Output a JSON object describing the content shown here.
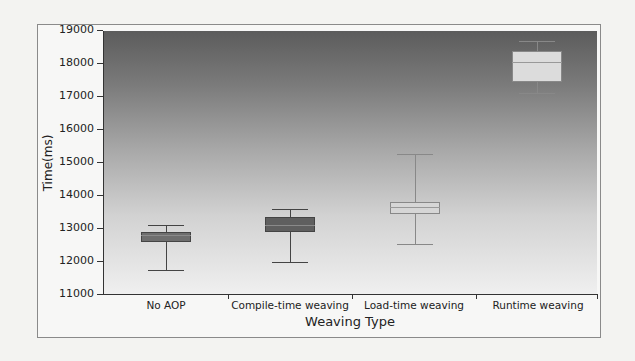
{
  "chart_data": {
    "type": "box",
    "title": "",
    "xlabel": "Weaving Type",
    "ylabel": "Time(ms)",
    "ylim": [
      11000,
      19000
    ],
    "yticks": [
      11000,
      12000,
      13000,
      14000,
      15000,
      16000,
      17000,
      18000,
      19000
    ],
    "categories": [
      "No AOP",
      "Compile-time weaving",
      "Load-time weaving",
      "Runtime weaving"
    ],
    "series": [
      {
        "name": "No AOP",
        "min": 11750,
        "q1": 12600,
        "median": 12800,
        "q3": 12900,
        "max": 13100,
        "color": "#6e6e6e"
      },
      {
        "name": "Compile-time weaving",
        "min": 12000,
        "q1": 12900,
        "median": 13100,
        "q3": 13350,
        "max": 13600,
        "color": "#5f5f5f"
      },
      {
        "name": "Load-time weaving",
        "min": 12550,
        "q1": 13450,
        "median": 13650,
        "q3": 13800,
        "max": 15250,
        "color": "#d6d6d6"
      },
      {
        "name": "Runtime weaving",
        "min": 17100,
        "q1": 17450,
        "median": 18050,
        "q3": 18400,
        "max": 18700,
        "color": "#dcdcdc"
      }
    ],
    "grid": false,
    "legend": null,
    "background": "vertical gradient dark gray (top) to near white (bottom)"
  },
  "axis": {
    "y_ticks": [
      "19000",
      "18000",
      "17000",
      "16000",
      "15000",
      "14000",
      "13000",
      "12000",
      "11000"
    ],
    "x_ticks": [
      "No AOP",
      "Compile-time weaving",
      "Load-time weaving",
      "Runtime weaving"
    ],
    "x_title": "Weaving Type",
    "y_title": "Time(ms)"
  }
}
